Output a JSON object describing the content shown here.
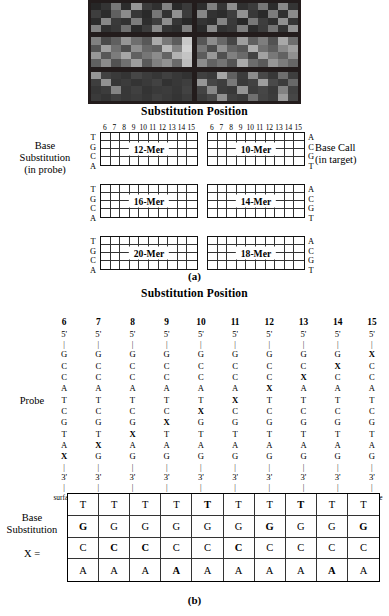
{
  "figure": {
    "panel_a_letter": "(a)",
    "panel_b_letter": "(b)",
    "title_a": "Substitution Position",
    "title_b": "Substitution Position"
  },
  "micrograph": {
    "name": "hybridization-array-image",
    "panels": [
      {
        "label": "panel-top-left",
        "cells": [
          38,
          52,
          120,
          44,
          150,
          60,
          48,
          130,
          42,
          58,
          62,
          44,
          96,
          140,
          55,
          42,
          118,
          50,
          145,
          60,
          44,
          136,
          58,
          50,
          124,
          46,
          62,
          142,
          54,
          40,
          130,
          48,
          56,
          112,
          42,
          60,
          138,
          52,
          46,
          128
        ]
      },
      {
        "label": "panel-top-right",
        "cells": [
          46,
          128,
          54,
          142,
          48,
          60,
          118,
          44,
          136,
          52,
          134,
          50,
          44,
          62,
          146,
          56,
          42,
          124,
          48,
          140,
          52,
          46,
          132,
          58,
          40,
          120,
          62,
          48,
          144,
          54,
          42,
          138,
          50,
          56,
          126,
          44,
          60,
          116,
          52,
          146
        ]
      },
      {
        "label": "panel-mid-left",
        "cells": [
          128,
          74,
          96,
          150,
          110,
          88,
          170,
          120,
          92,
          200,
          84,
          160,
          112,
          78,
          142,
          104,
          96,
          186,
          130,
          210,
          152,
          88,
          124,
          166,
          96,
          118,
          140,
          100,
          178,
          196,
          96,
          140,
          82,
          112,
          158,
          90,
          128,
          146,
          106,
          190
        ]
      },
      {
        "label": "panel-mid-right",
        "cells": [
          86,
          140,
          104,
          70,
          158,
          96,
          126,
          82,
          168,
          110,
          118,
          76,
          146,
          100,
          88,
          174,
          112,
          94,
          136,
          160,
          92,
          152,
          80,
          128,
          106,
          66,
          162,
          120,
          98,
          144,
          140,
          98,
          116,
          84,
          170,
          108,
          90,
          150,
          124,
          102
        ]
      },
      {
        "label": "panel-bot-left",
        "cells": [
          150,
          66,
          58,
          52,
          70,
          60,
          54,
          64,
          56,
          50,
          62,
          146,
          54,
          60,
          52,
          58,
          66,
          50,
          56,
          62,
          54,
          60,
          132,
          56,
          64,
          52,
          58,
          60,
          54,
          66,
          58,
          52,
          62,
          56,
          60,
          54,
          64,
          58,
          52,
          60
        ]
      },
      {
        "label": "panel-bot-right",
        "cells": [
          64,
          58,
          166,
          96,
          60,
          140,
          72,
          56,
          110,
          62,
          150,
          70,
          62,
          120,
          58,
          66,
          158,
          74,
          60,
          104,
          68,
          136,
          60,
          56,
          148,
          62,
          70,
          58,
          130,
          66,
          60,
          72,
          144,
          64,
          58,
          112,
          68,
          60,
          156,
          70
        ]
      }
    ]
  },
  "part_a": {
    "left_label_lines": [
      "Base",
      "Substitution",
      "(in probe)"
    ],
    "right_label_lines": [
      "Base Call",
      "(in target)"
    ],
    "column_numbers": [
      "6",
      "7",
      "8",
      "9",
      "10",
      "11",
      "12",
      "13",
      "14",
      "15"
    ],
    "left_bases": [
      "T",
      "G",
      "C",
      "A"
    ],
    "right_bases": [
      "A",
      "C",
      "G",
      "T"
    ],
    "grids": [
      {
        "name": "grid-12-mer",
        "label": "12-Mer",
        "row": 0,
        "col": 0
      },
      {
        "name": "grid-10-mer",
        "label": "10-Mer",
        "row": 0,
        "col": 1
      },
      {
        "name": "grid-16-mer",
        "label": "16-Mer",
        "row": 1,
        "col": 0
      },
      {
        "name": "grid-14-mer",
        "label": "14-Mer",
        "row": 1,
        "col": 1
      },
      {
        "name": "grid-20-mer",
        "label": "20-Mer",
        "row": 2,
        "col": 0
      },
      {
        "name": "grid-18-mer",
        "label": "18-Mer",
        "row": 2,
        "col": 1
      }
    ]
  },
  "part_b": {
    "probe_label": "Probe",
    "matrix_label_lines": [
      "Base",
      "Substitution"
    ],
    "matrix_x_label": "X =",
    "surface_label": "surface",
    "five_prime": "5'",
    "three_prime": "3'",
    "base_sequence": [
      "G",
      "C",
      "C",
      "A",
      "T",
      "C",
      "G",
      "T",
      "A",
      "G"
    ],
    "columns": [
      {
        "header": "6",
        "x_index": 9
      },
      {
        "header": "7",
        "x_index": 8
      },
      {
        "header": "8",
        "x_index": 7
      },
      {
        "header": "9",
        "x_index": 6
      },
      {
        "header": "10",
        "x_index": 5
      },
      {
        "header": "11",
        "x_index": 4
      },
      {
        "header": "12",
        "x_index": 3
      },
      {
        "header": "13",
        "x_index": 2
      },
      {
        "header": "14",
        "x_index": 1
      },
      {
        "header": "15",
        "x_index": 0
      }
    ],
    "matrix_rows": [
      "T",
      "G",
      "C",
      "A"
    ],
    "matrix_bold": [
      [
        false,
        false,
        false,
        false,
        true,
        false,
        false,
        true,
        false,
        false
      ],
      [
        true,
        false,
        false,
        false,
        false,
        false,
        true,
        false,
        false,
        true
      ],
      [
        false,
        true,
        true,
        false,
        false,
        true,
        false,
        false,
        false,
        false
      ],
      [
        false,
        false,
        false,
        true,
        false,
        false,
        false,
        false,
        true,
        false
      ]
    ]
  }
}
